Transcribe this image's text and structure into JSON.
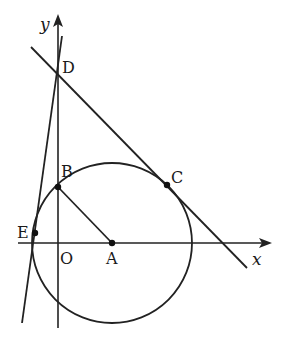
{
  "diagram": {
    "axes": {
      "x_label": "x",
      "y_label": "y",
      "origin_label": "O",
      "stroke": "#222222"
    },
    "points": {
      "A": {
        "label": "A",
        "x": 112,
        "y": 243
      },
      "B": {
        "label": "B",
        "x": 58,
        "y": 187
      },
      "C": {
        "label": "C",
        "x": 167,
        "y": 185
      },
      "D": {
        "label": "D",
        "x": 58,
        "y": 78
      },
      "E": {
        "label": "E",
        "x": 35,
        "y": 233
      }
    },
    "circle": {
      "center": "A",
      "radius": 80
    },
    "segments": [
      {
        "name": "segment-AB",
        "from": "A",
        "to": "B"
      }
    ],
    "lines": [
      {
        "name": "tangent-line-DC",
        "through": [
          "D",
          "C"
        ]
      },
      {
        "name": "tangent-line-ED",
        "through": [
          "E",
          "D"
        ]
      }
    ]
  }
}
